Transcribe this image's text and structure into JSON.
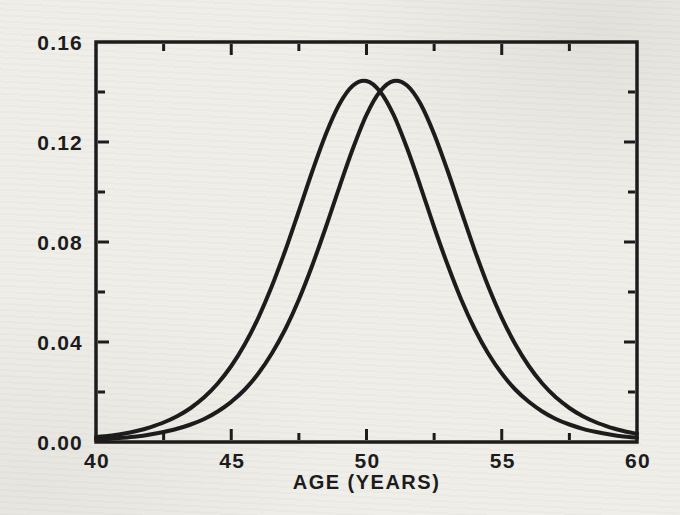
{
  "colors": {
    "ink": "#1c1c1c",
    "paper": "#f0eee9"
  },
  "chart_data": {
    "type": "line",
    "title": "",
    "xlabel": "AGE (YEARS)",
    "ylabel": "",
    "xlim": [
      40,
      60
    ],
    "ylim": [
      0,
      0.16
    ],
    "grid": false,
    "legend": "none",
    "frame": "box-with-inward-ticks",
    "x_major_ticks": [
      40,
      45,
      50,
      55,
      60
    ],
    "x_tick_labels": [
      "40",
      "45",
      "50",
      "55",
      "60"
    ],
    "x_minor_ticks": [
      42.5,
      47.5,
      52.5,
      57.5
    ],
    "y_major_ticks": [
      0,
      0.04,
      0.08,
      0.12,
      0.16
    ],
    "y_tick_labels": [
      "0.00",
      "0.04",
      "0.08",
      "0.12",
      "0.16"
    ],
    "y_minor_ticks": [
      0.02,
      0.06,
      0.1,
      0.14
    ],
    "x": [
      40,
      40.5,
      41,
      41.5,
      42,
      42.5,
      43,
      43.5,
      44,
      44.5,
      45,
      45.5,
      46,
      46.5,
      47,
      47.5,
      48,
      48.5,
      49,
      49.5,
      50,
      50.5,
      51,
      51.5,
      52,
      52.5,
      53,
      53.5,
      54,
      54.5,
      55,
      55.5,
      56,
      56.5,
      57,
      57.5,
      58,
      58.5,
      59,
      59.5,
      60
    ],
    "series": [
      {
        "name": "left-curve",
        "peak_x": 49.9,
        "peak_y": 0.144,
        "values": [
          0.0019,
          0.0025,
          0.0033,
          0.0044,
          0.0059,
          0.0078,
          0.0103,
          0.0136,
          0.0179,
          0.0234,
          0.0304,
          0.0391,
          0.0497,
          0.0623,
          0.0767,
          0.0924,
          0.1084,
          0.1232,
          0.1352,
          0.1426,
          0.1444,
          0.1402,
          0.1309,
          0.1175,
          0.1021,
          0.086,
          0.0708,
          0.057,
          0.0452,
          0.0354,
          0.0274,
          0.021,
          0.0161,
          0.0122,
          0.0092,
          0.007,
          0.0053,
          0.004,
          0.003,
          0.0022,
          0.0017
        ]
      },
      {
        "name": "right-curve",
        "peak_x": 51.1,
        "peak_y": 0.144,
        "values": [
          0.0009,
          0.0013,
          0.0017,
          0.0022,
          0.003,
          0.004,
          0.0053,
          0.007,
          0.0092,
          0.0122,
          0.0161,
          0.021,
          0.0274,
          0.0354,
          0.0452,
          0.057,
          0.0708,
          0.086,
          0.1021,
          0.1175,
          0.1309,
          0.1402,
          0.1444,
          0.1426,
          0.1352,
          0.1232,
          0.1084,
          0.0924,
          0.0767,
          0.0623,
          0.0497,
          0.0391,
          0.0304,
          0.0234,
          0.0179,
          0.0136,
          0.0103,
          0.0078,
          0.0059,
          0.0044,
          0.0033
        ]
      }
    ]
  }
}
